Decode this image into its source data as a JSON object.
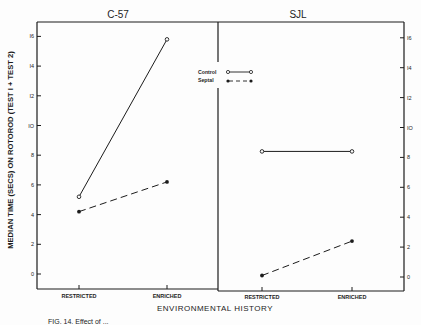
{
  "chart_data": {
    "type": "line",
    "title": "",
    "panels": [
      {
        "title": "C-57",
        "categories": [
          "RESTRICTED",
          "ENRICHED"
        ],
        "series": [
          {
            "name": "Control",
            "style": "solid",
            "marker": "open-circle",
            "values": [
              5.2,
              15.8
            ]
          },
          {
            "name": "Septal",
            "style": "dashed",
            "marker": "filled-circle",
            "values": [
              4.2,
              6.2
            ]
          }
        ]
      },
      {
        "title": "SJL",
        "categories": [
          "RESTRICTED",
          "ENRICHED"
        ],
        "series": [
          {
            "name": "Control",
            "style": "solid",
            "marker": "open-circle",
            "values": [
              8.4,
              8.4
            ]
          },
          {
            "name": "Septal",
            "style": "dashed",
            "marker": "filled-circle",
            "values": [
              0.1,
              2.4
            ]
          }
        ]
      }
    ],
    "xlabel": "ENVIRONMENTAL HISTORY",
    "ylabel": "MEDIAN TIME (SECS) ON ROTOROD (TEST I + TEST 2)",
    "yticks": [
      0,
      2,
      4,
      6,
      8,
      10,
      12,
      14,
      16
    ],
    "ytick_labels": [
      "0",
      "2",
      "4",
      "6",
      "8",
      "IO",
      "I2",
      "I4",
      "I6"
    ],
    "ylim": [
      -1.5,
      17
    ],
    "grid": false,
    "legend": {
      "position": "top-center",
      "entries": [
        "Control",
        "Septal"
      ]
    }
  },
  "labels": {
    "panel_left": "C-57",
    "panel_right": "SJL",
    "xlabel": "ENVIRONMENTAL HISTORY",
    "ylabel": "MEDIAN TIME (SECS) ON ROTOROD (TEST I + TEST 2)",
    "legend_control": "Control",
    "legend_septal": "Septal",
    "cat_restricted": "RESTRICTED",
    "cat_enriched": "ENRICHED",
    "caption": "FIG. 14.  Effect of ..."
  },
  "colors": {
    "ink": "#1c1c1c",
    "paper": "#fdfdfd"
  }
}
